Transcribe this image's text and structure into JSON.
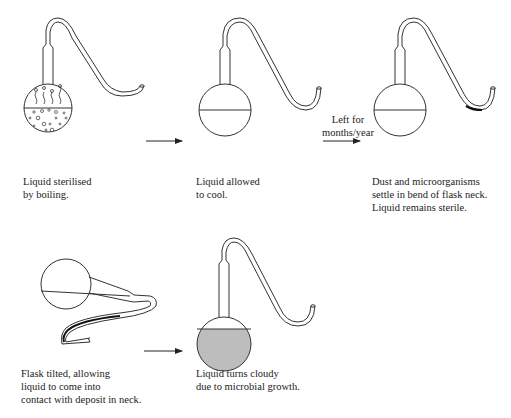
{
  "diagram": {
    "colors": {
      "line": "#333333",
      "cloudy_liquid": "#bdbdbd",
      "background": "#ffffff"
    },
    "steps": [
      {
        "id": "boil",
        "caption_lines": [
          "Liquid sterilised",
          "by boiling."
        ],
        "flask_state": "boiling with bubbles and steam"
      },
      {
        "id": "cool",
        "caption_lines": [
          "Liquid allowed",
          "to cool."
        ],
        "flask_state": "clear liquid"
      },
      {
        "id": "settle",
        "caption_lines": [
          "Dust and microorganisms",
          "settle in bend of flask neck.",
          "Liquid remains sterile."
        ],
        "flask_state": "clear liquid, deposit in neck bend"
      },
      {
        "id": "tilt",
        "caption_lines": [
          "Flask tilted, allowing",
          "liquid to come into",
          "contact with deposit in neck."
        ],
        "flask_state": "tilted, liquid in neck"
      },
      {
        "id": "cloudy",
        "caption_lines": [
          "Liquid turns cloudy",
          "due to microbial growth."
        ],
        "flask_state": "cloudy liquid"
      }
    ],
    "arrows": [
      {
        "from": "boil",
        "to": "cool",
        "label_lines": []
      },
      {
        "from": "cool",
        "to": "settle",
        "label_lines": [
          "Left for",
          "months/year"
        ]
      },
      {
        "from": "tilt",
        "to": "cloudy",
        "label_lines": []
      }
    ]
  }
}
